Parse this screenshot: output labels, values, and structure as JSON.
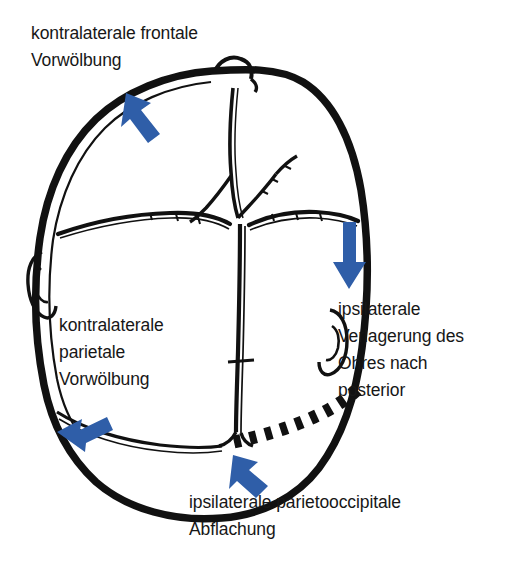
{
  "figure": {
    "view": "vertex",
    "ink_color": "#111111",
    "arrow_color": "#2F5EA8",
    "background": "#ffffff"
  },
  "labels": {
    "frontal": "kontralaterale frontale\nVorwölbung",
    "parietal": "kontralaterale\nparietale\nVorwölbung",
    "ear": "ipsilaterale\nVerlagerung des\nOhres nach\nposterior",
    "occipital": "ipsilaterale parietooccipitale\nAbflachung"
  },
  "annotations": [
    {
      "name": "arrow-frontal",
      "label_ref": "frontal",
      "direction": "up-left",
      "color": "#2F5EA8",
      "points_to": "kontralaterale frontale Vorwölbung"
    },
    {
      "name": "arrow-ear",
      "label_ref": "ear",
      "direction": "down",
      "color": "#2F5EA8",
      "points_to": "ipsilaterale Verlagerung des Ohres nach posterior"
    },
    {
      "name": "arrow-parietal",
      "label_ref": "parietal",
      "direction": "down-left",
      "color": "#2F5EA8",
      "points_to": "kontralaterale parietale Vorwölbung"
    },
    {
      "name": "arrow-occipital",
      "label_ref": "occipital",
      "direction": "up-left",
      "color": "#2F5EA8",
      "points_to": "ipsilaterale parietooccipitale Abflachung"
    }
  ],
  "anatomy": {
    "skull_outline": "asymmetrischer Schädelumriss",
    "sutures": [
      "Sutura metopica",
      "Sutura coronalis",
      "Sutura sagittalis"
    ],
    "fontanelle": "Fontanella anterior (rautenförmig)",
    "ears": [
      "linkes Ohr",
      "rechtes Ohr nach posterior verlagert"
    ],
    "flattening_marker": "gestrichelte Linie markiert die abgeflachte parietooccipitale Region"
  }
}
